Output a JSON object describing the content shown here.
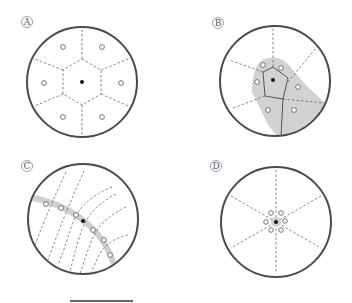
{
  "panels": [
    {
      "id": "A",
      "label": "A",
      "description": "Regular hexagonal Voronoi partition around a central point with six neighbors",
      "circle": {
        "cx": 82,
        "cy": 82,
        "r": 55
      },
      "center_point": {
        "x": 82,
        "y": 82
      },
      "neighbor_points": [
        [
          63,
          47
        ],
        [
          102,
          47
        ],
        [
          44,
          83
        ],
        [
          121,
          83
        ],
        [
          63,
          117
        ],
        [
          102,
          117
        ]
      ]
    },
    {
      "id": "B",
      "label": "B",
      "description": "Irregular Voronoi cells with shaded elongated region",
      "circle": {
        "cx": 275,
        "cy": 81,
        "r": 55
      },
      "center_point": {
        "x": 273,
        "y": 80
      },
      "neighbor_points": [
        [
          263,
          65
        ],
        [
          281,
          68
        ],
        [
          257,
          82
        ],
        [
          298,
          87
        ],
        [
          268,
          110
        ],
        [
          294,
          110
        ]
      ]
    },
    {
      "id": "C",
      "label": "C",
      "description": "Points aligned along a curved band with curved dashed boundaries",
      "circle": {
        "cx": 83,
        "cy": 219,
        "r": 55
      },
      "center_point": {
        "x": 83,
        "y": 221
      },
      "neighbor_points": [
        [
          46,
          204
        ],
        [
          61,
          208
        ],
        [
          76,
          215
        ],
        [
          93,
          230
        ],
        [
          104,
          240
        ],
        [
          110,
          255
        ]
      ]
    },
    {
      "id": "D",
      "label": "D",
      "description": "Tightly clustered points around center with radial dashed lines",
      "circle": {
        "cx": 276,
        "cy": 222,
        "r": 55
      },
      "center_point": {
        "x": 276,
        "y": 222
      },
      "neighbor_points": [
        [
          271,
          213
        ],
        [
          281,
          213
        ],
        [
          266,
          222
        ],
        [
          285,
          221
        ],
        [
          271,
          230
        ],
        [
          281,
          230
        ]
      ]
    }
  ],
  "scale_bar": {
    "x1": 70,
    "x2": 133,
    "y": 301
  }
}
